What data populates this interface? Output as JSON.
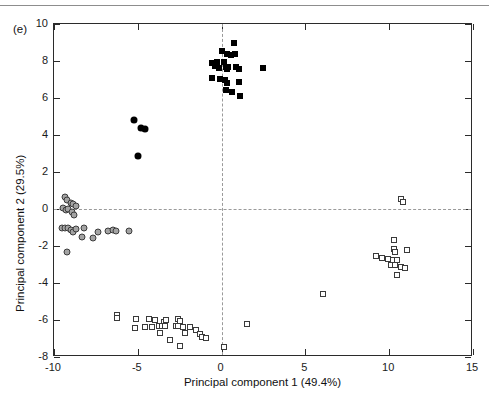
{
  "figure": {
    "panel_label": "(e)",
    "top_rule": true
  },
  "chart_data": {
    "type": "scatter",
    "title": "",
    "xlabel": "Principal component 1 (49.4%)",
    "ylabel": "Principal component 2 (29.5%)",
    "xlim": [
      -10,
      15
    ],
    "ylim": [
      -8,
      10
    ],
    "xticks": [
      -10,
      -5,
      0,
      5,
      10,
      15
    ],
    "yticks": [
      -8,
      -6,
      -4,
      -2,
      0,
      2,
      4,
      6,
      8,
      10
    ],
    "xticklabels": [
      "-10",
      "-5",
      "0",
      "5",
      "10",
      "15"
    ],
    "yticklabels": [
      "-8",
      "-6",
      "-4",
      "-2",
      "0",
      "2",
      "4",
      "6",
      "8",
      "10"
    ],
    "grid": false,
    "legend": "none",
    "reference_lines": [
      {
        "axis": "x",
        "value": 0,
        "style": "dashed",
        "color": "#9a9a9a"
      },
      {
        "axis": "y",
        "value": 0,
        "style": "dashed",
        "color": "#9a9a9a"
      }
    ],
    "series": [
      {
        "name": "filled-square",
        "marker": "filled-square",
        "color": "#000000",
        "points": [
          [
            0.75,
            8.95
          ],
          [
            0.05,
            8.55
          ],
          [
            0.3,
            8.4
          ],
          [
            0.55,
            8.3
          ],
          [
            0.8,
            8.4
          ],
          [
            -0.55,
            7.9
          ],
          [
            -0.4,
            7.75
          ],
          [
            -0.25,
            7.95
          ],
          [
            -0.15,
            7.6
          ],
          [
            0.15,
            7.95
          ],
          [
            0.25,
            7.7
          ],
          [
            0.4,
            7.7
          ],
          [
            0.3,
            7.55
          ],
          [
            0.85,
            7.65
          ],
          [
            1.05,
            7.55
          ],
          [
            2.45,
            7.6
          ],
          [
            -0.55,
            7.1
          ],
          [
            -0.1,
            7.05
          ],
          [
            0.2,
            6.95
          ],
          [
            0.35,
            6.8
          ],
          [
            1.05,
            6.85
          ],
          [
            0.25,
            6.45
          ],
          [
            0.65,
            6.35
          ],
          [
            1.1,
            6.1
          ]
        ]
      },
      {
        "name": "filled-circle",
        "marker": "filled-circle",
        "color": "#000000",
        "points": [
          [
            -5.25,
            4.8
          ],
          [
            -4.8,
            4.4
          ],
          [
            -4.6,
            4.35
          ],
          [
            -5.0,
            2.85
          ]
        ]
      },
      {
        "name": "gray-circle",
        "marker": "gray-circle",
        "color": "#a3a3a3",
        "points": [
          [
            -9.35,
            0.65
          ],
          [
            -9.2,
            0.5
          ],
          [
            -9.0,
            0.35
          ],
          [
            -8.85,
            0.25
          ],
          [
            -8.7,
            0.15
          ],
          [
            -9.45,
            0.05
          ],
          [
            -9.3,
            -0.05
          ],
          [
            -9.15,
            0.0
          ],
          [
            -8.95,
            -0.15
          ],
          [
            -8.8,
            -0.3
          ],
          [
            -9.55,
            -1.0
          ],
          [
            -9.35,
            -1.05
          ],
          [
            -9.15,
            -1.0
          ],
          [
            -9.0,
            -1.15
          ],
          [
            -8.85,
            -1.25
          ],
          [
            -8.7,
            -1.1
          ],
          [
            -8.2,
            -1.05
          ],
          [
            -8.3,
            -1.5
          ],
          [
            -7.7,
            -1.55
          ],
          [
            -7.35,
            -1.25
          ],
          [
            -6.75,
            -1.2
          ],
          [
            -6.45,
            -1.15
          ],
          [
            -6.3,
            -1.2
          ],
          [
            -5.55,
            -1.2
          ],
          [
            -9.25,
            -2.3
          ]
        ]
      },
      {
        "name": "open-square",
        "marker": "open-square",
        "color": "#3a3a3a",
        "points": [
          [
            10.7,
            0.55
          ],
          [
            10.8,
            0.4
          ],
          [
            10.3,
            -1.7
          ],
          [
            10.3,
            -2.15
          ],
          [
            10.35,
            -2.3
          ],
          [
            11.05,
            -2.2
          ],
          [
            9.2,
            -2.55
          ],
          [
            9.55,
            -2.65
          ],
          [
            9.95,
            -2.7
          ],
          [
            10.2,
            -2.75
          ],
          [
            10.45,
            -2.75
          ],
          [
            10.1,
            -3.0
          ],
          [
            10.35,
            -3.05
          ],
          [
            10.7,
            -3.15
          ],
          [
            10.95,
            -3.2
          ],
          [
            10.45,
            -3.55
          ],
          [
            6.05,
            -4.6
          ],
          [
            -6.25,
            -5.75
          ],
          [
            -6.25,
            -5.9
          ],
          [
            -5.1,
            -5.95
          ],
          [
            -4.35,
            -5.95
          ],
          [
            -3.95,
            -6.0
          ],
          [
            -3.45,
            -6.1
          ],
          [
            -3.3,
            -6.0
          ],
          [
            -2.6,
            -5.95
          ],
          [
            -2.5,
            -6.05
          ],
          [
            1.5,
            -6.2
          ],
          [
            -5.15,
            -6.45
          ],
          [
            -4.55,
            -6.4
          ],
          [
            -4.15,
            -6.4
          ],
          [
            -3.75,
            -6.3
          ],
          [
            -3.55,
            -6.35
          ],
          [
            -3.4,
            -6.3
          ],
          [
            -2.75,
            -6.35
          ],
          [
            -2.6,
            -6.3
          ],
          [
            -2.3,
            -6.4
          ],
          [
            -1.9,
            -6.4
          ],
          [
            -1.55,
            -6.55
          ],
          [
            -3.65,
            -6.7
          ],
          [
            -2.2,
            -6.7
          ],
          [
            -1.3,
            -6.75
          ],
          [
            -1.15,
            -6.9
          ],
          [
            -0.95,
            -6.95
          ],
          [
            -3.05,
            -7.1
          ],
          [
            -2.5,
            -7.4
          ],
          [
            0.15,
            -7.45
          ]
        ]
      }
    ]
  }
}
